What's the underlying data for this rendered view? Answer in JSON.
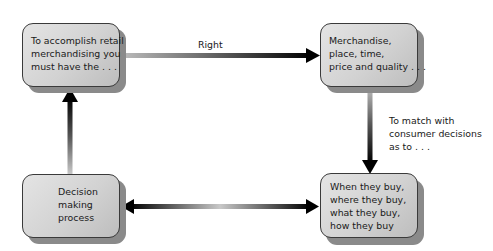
{
  "diagram": {
    "type": "flow-cycle",
    "boxes": [
      {
        "id": "retail-merchandising",
        "text": "To accomplish retail\nmerchandising you\nmust have the . . ."
      },
      {
        "id": "five-rights",
        "text": "Merchandise,\nplace, time,\nprice and quality . . ."
      },
      {
        "id": "decision-making",
        "text": "Decision\nmaking\nprocess"
      },
      {
        "id": "consumer-decisions",
        "text": "When they buy,\nwhere they buy,\nwhat they buy,\nhow they buy"
      }
    ],
    "arrows": [
      {
        "from": "retail-merchandising",
        "to": "five-rights",
        "label": "Right"
      },
      {
        "from": "five-rights",
        "to": "consumer-decisions",
        "label": "To match with\nconsumer decisions\nas to . . ."
      },
      {
        "from": "decision-making",
        "to": "consumer-decisions",
        "label": "",
        "bidirectional": true
      },
      {
        "from": "decision-making",
        "to": "retail-merchandising",
        "label": ""
      }
    ]
  }
}
